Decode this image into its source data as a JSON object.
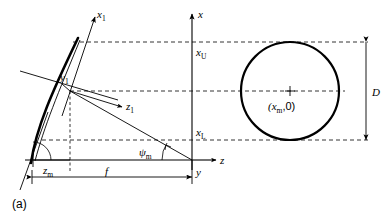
{
  "figure": {
    "panel_tag": "(a)"
  },
  "axes": {
    "global": [
      {
        "name": "x-axis",
        "label": "x",
        "orientation": "vertical-up"
      },
      {
        "name": "z-axis",
        "label": "z",
        "orientation": "horizontal-right"
      },
      {
        "name": "y-axis",
        "label": "y",
        "orientation": "out-of-plane"
      }
    ],
    "local": [
      {
        "name": "x1-axis",
        "label": "x",
        "sub": "1"
      },
      {
        "name": "y1-axis",
        "label": "y",
        "sub": "1"
      },
      {
        "name": "z1-axis",
        "label": "z",
        "sub": "1"
      }
    ]
  },
  "labels": {
    "x_upper": {
      "base": "x",
      "sub": "U"
    },
    "x_lower": {
      "base": "x",
      "sub": "L"
    },
    "z_m": {
      "base": "z",
      "sub": "m"
    },
    "psi_m": {
      "base": "ψ",
      "sub": "m"
    },
    "focal": "f",
    "diameter": "D",
    "center_point": "(x",
    "center_point_sub": "m",
    "center_point_tail": ",0)"
  },
  "colors": {
    "stroke": "#000000",
    "background": "#ffffff"
  },
  "geometry": {
    "origin": {
      "x": 192,
      "y": 160
    },
    "vertex_point": {
      "x": 70,
      "y": 91
    },
    "arc_foot": {
      "x": 33,
      "y": 160
    },
    "circle": {
      "cx": 290,
      "cy": 91,
      "r": 49
    },
    "dashed_upper_y": 42,
    "dashed_mid_y": 91,
    "dashed_lower_y": 140,
    "focal_dim_y": 177
  }
}
